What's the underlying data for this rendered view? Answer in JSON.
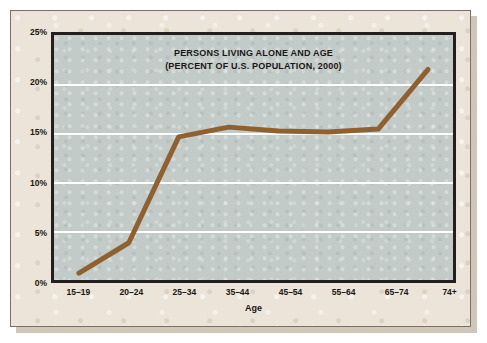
{
  "chart_data": {
    "type": "line",
    "title": "PERSONS LIVING ALONE AND AGE",
    "subtitle": "(PERCENT OF U.S. POPULATION, 2000)",
    "xlabel": "Age",
    "ylabel": "",
    "categories": [
      "15–19",
      "20–24",
      "25–34",
      "35–44",
      "45–54",
      "55–64",
      "65–74",
      "74+"
    ],
    "values": [
      0.7,
      3.8,
      14.6,
      15.6,
      15.2,
      15.1,
      15.4,
      21.5
    ],
    "series": [
      {
        "name": "Percent living alone",
        "values": [
          0.7,
          3.8,
          14.6,
          15.6,
          15.2,
          15.1,
          15.4,
          21.5
        ]
      }
    ],
    "ylim": [
      0,
      25
    ],
    "yticks": [
      0,
      5,
      10,
      15,
      20,
      25
    ],
    "ytick_labels": [
      "0%",
      "5%",
      "10%",
      "15%",
      "20%",
      "25%"
    ],
    "grid": true,
    "gridline_color": "#ffffff",
    "legend": false,
    "legend_position": "none",
    "line_color": "#91602f",
    "plot_background": "#c3cbc9",
    "page_background": "#ece4d9",
    "frame_color": "#231f1c",
    "text_color": "#1b1713"
  }
}
